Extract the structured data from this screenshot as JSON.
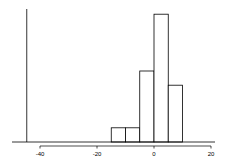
{
  "chart_data": {
    "type": "bar",
    "subtype": "histogram",
    "title": "",
    "xlabel": "",
    "ylabel": "",
    "bin_edges": [
      -15,
      -10,
      -5,
      0,
      5,
      10
    ],
    "categories": [
      "[-15,-10)",
      "[-10,-5)",
      "[-5,0)",
      "[0,5)",
      "[5,10)"
    ],
    "values": [
      1,
      1,
      5,
      9,
      4
    ],
    "xlim": [
      -45,
      20
    ],
    "ylim": [
      0,
      9
    ],
    "x_ticks": [
      -40,
      -20,
      0,
      20
    ],
    "x_tick_labels": [
      "-40",
      "-20",
      "0",
      "20"
    ],
    "y_axis_shown": false,
    "grid": false,
    "legend": null,
    "vertical_reference_line_x": -45,
    "bar_fill": "#ffffff",
    "bar_stroke": "#000000"
  }
}
